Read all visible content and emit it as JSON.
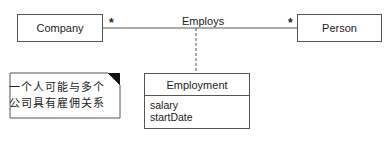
{
  "diagram": {
    "type": "UML class diagram - association class",
    "classes": [
      {
        "name": "Company"
      },
      {
        "name": "Person"
      }
    ],
    "association": {
      "name": "Employs",
      "left_multiplicity": "*",
      "right_multiplicity": "*"
    },
    "association_class": {
      "name": "Employment",
      "attributes": [
        "salary",
        "startDate"
      ]
    },
    "note": {
      "lines": [
        "一个人可能与多个",
        "公司具有雇佣关系"
      ]
    }
  }
}
